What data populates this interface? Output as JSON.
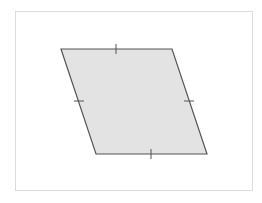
{
  "diagram": {
    "shape": "rhombus",
    "fill_color": "#e3e3e3",
    "stroke_color": "#555555",
    "frame_color": "#dcdcdc",
    "vertices": [
      [
        61,
        49
      ],
      [
        172,
        49
      ],
      [
        207,
        154
      ],
      [
        96,
        154
      ]
    ],
    "tick_marks": [
      {
        "side": "top",
        "x": 116,
        "y": 49
      },
      {
        "side": "right",
        "x": 189,
        "y": 101
      },
      {
        "side": "bottom",
        "x": 151,
        "y": 154
      },
      {
        "side": "left",
        "x": 79,
        "y": 101
      }
    ]
  }
}
